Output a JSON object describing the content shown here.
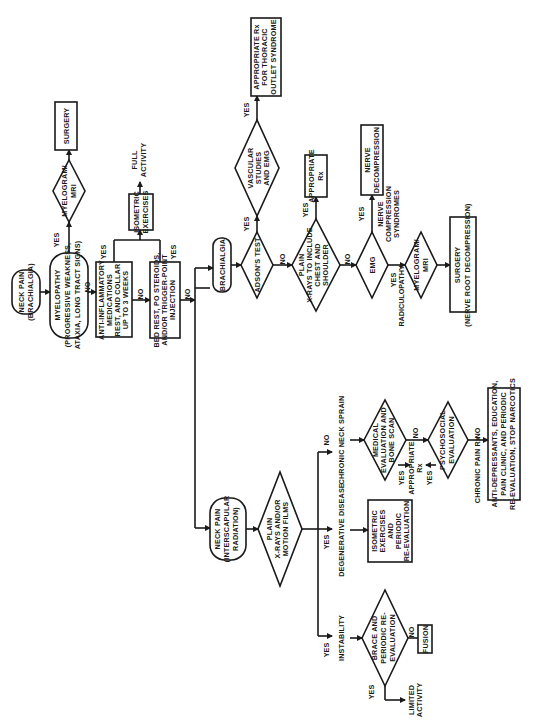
{
  "diagram": {
    "orientation": "rotated-90-ccw",
    "nodes": {
      "start": {
        "l1": "NECK PAIN",
        "l2": "(BRACHIALGIA)"
      },
      "myelopathy": {
        "l1": "MYELOPATHY",
        "l2": "(PROGRESSIVE WEAKNESS,",
        "l3": "ATAXIA, LONG TRACT SIGNS)"
      },
      "myelogram1": {
        "l1": "MYELOGRAM/",
        "l2": "MRI"
      },
      "surgery1": {
        "l1": "SURGERY"
      },
      "anti_inflam": {
        "l1": "ANTI-INFLAMMATORY",
        "l2": "MEDICATIONS",
        "l3": "REST, AND COLLAR",
        "l4": "UP TO 3 WEEKS"
      },
      "isometric1": {
        "l1": "ISOMETRIC",
        "l2": "EXERCISES"
      },
      "full_activity": {
        "l1": "FULL",
        "l2": "ACTIVITY"
      },
      "bed_rest": {
        "l1": "BED REST, PO STEROIDS,",
        "l2": "AND/OR TRIGGER-POINT",
        "l3": "INJECTION"
      },
      "brachialgia": {
        "l1": "BRACHIALGIA"
      },
      "adsons": {
        "l1": "ADSON'S TEST"
      },
      "vascular": {
        "l1": "VASCULAR",
        "l2": "STUDIES",
        "l3": "AND EMG"
      },
      "thoracic_rx": {
        "l1": "APPROPRIATE Rx",
        "l2": "FOR THORACIC",
        "l3": "OUTLET SYNDROME"
      },
      "plain_xray_chest": {
        "l1": "PLAIN",
        "l2": "X-RAYS TO INCLUDE",
        "l3": "CHEST AND",
        "l4": "SHOULDER"
      },
      "appropriate_rx1": {
        "l1": "APPROPRIATE",
        "l2": "Rx"
      },
      "emg": {
        "l1": "EMG"
      },
      "nerve_decomp": {
        "l1": "NERVE",
        "l2": "DECOMPRESSION"
      },
      "nerve_comp_label": {
        "l1": "NERVE",
        "l2": "COMPRESSION",
        "l3": "SYNDROMES"
      },
      "radiculopathy_label": {
        "l1": "YES",
        "l2": "RADICULOPATHY"
      },
      "myelogram2": {
        "l1": "MYELOGRAM/",
        "l2": "MRI"
      },
      "surgery2": {
        "l1": "SURGERY",
        "l2": "(NERVE ROOT DECOMPRESSION)"
      },
      "neck_pain_inter": {
        "l1": "NECK PAIN",
        "l2": "(INTERSCAPULAR",
        "l3": "RADIATION)"
      },
      "plain_xray_motion": {
        "l1": "PLAIN",
        "l2": "X-RAYS AND/OR",
        "l3": "MOTION FILMS"
      },
      "instability": {
        "l1": "INSTABILITY"
      },
      "degenerative": {
        "l1": "DEGENERATIVE DISEASE"
      },
      "chronic_sprain": {
        "l1": "CHRONIC NECK SPRAIN"
      },
      "brace": {
        "l1": "BRACE AND",
        "l2": "PERIODIC RE-",
        "l3": "EVALUATION"
      },
      "fusion": {
        "l1": "FUSION"
      },
      "limited_activity": {
        "l1": "LIMITED",
        "l2": "ACTIVITY"
      },
      "isometric2": {
        "l1": "ISOMETRIC",
        "l2": "EXERCISES",
        "l3": "AND",
        "l4": "PERIODIC",
        "l5": "RE-EVALUATION"
      },
      "medical_eval": {
        "l1": "MEDICAL",
        "l2": "EVALUATION AND",
        "l3": "BONE SCAN"
      },
      "appropriate_rx2": {
        "l1": "APPROPRIATE",
        "l2": "Rx"
      },
      "psychosocial": {
        "l1": "PSYCHOSOCIAL",
        "l2": "EVALUATION"
      },
      "chronic_pain_label": {
        "l1": "CHRONIC PAIN Rx"
      },
      "chronic_pain_rx": {
        "l1": "ANTI-DEPRESSANTS, EDUCATION,",
        "l2": "PAIN CLINIC, AND PERIODIC",
        "l3": "RE-EVALUATION, STOP NARCOTICS"
      }
    },
    "edge_labels": {
      "yes": "YES",
      "no": "NO"
    }
  }
}
